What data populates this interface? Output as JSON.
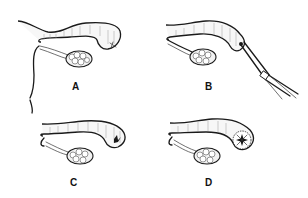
{
  "figure": {
    "panels": [
      {
        "id": "A",
        "label": "A",
        "content": "fallopian tube with fimbrial end and ovary; uterine wall at left"
      },
      {
        "id": "B",
        "label": "B",
        "content": "fallopian tube with forceps/clamp instrument grasping fimbrial end"
      },
      {
        "id": "C",
        "label": "C",
        "content": "fallopian tube with occluded fimbrial end"
      },
      {
        "id": "D",
        "label": "D",
        "content": "fallopian tube with everted / starred fimbrial opening"
      }
    ]
  }
}
